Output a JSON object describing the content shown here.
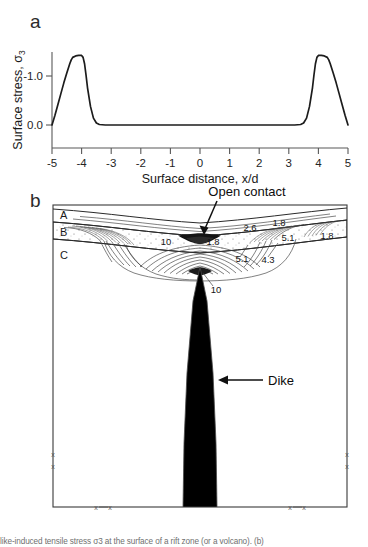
{
  "figure": {
    "panels": [
      {
        "letter": "a"
      },
      {
        "letter": "b"
      }
    ]
  },
  "panel_a": {
    "letter": "a",
    "xlabel_main": "Surface distance, ",
    "xlabel_var": "x/d",
    "ylabel_main": "Surface stress, ",
    "ylabel_var": "σ",
    "ylabel_sub": "3",
    "x_ticks": [
      "-5",
      "-4",
      "-3",
      "-2",
      "-1",
      "0",
      "1",
      "2",
      "3",
      "4",
      "5"
    ],
    "y_ticks": [
      "-1.0",
      "0.0"
    ]
  },
  "panel_b": {
    "letter": "b",
    "layer_labels": [
      "A",
      "B",
      "C"
    ],
    "contour_labels": [
      "1.8",
      "2.6",
      "1.8",
      "5.1",
      "1.8",
      "10",
      "5.1",
      "4.3",
      "10"
    ],
    "annotations": [
      {
        "text": "Open contact"
      },
      {
        "text": "Dike"
      }
    ],
    "boundary_marks": [
      "x",
      "x",
      "x",
      "x",
      "x",
      "x",
      "x",
      "x"
    ],
    "dike_fill": "#808080"
  },
  "caption": {
    "text": "like-induced tensile stress σ3 at the surface of a rift zone (or a volcano).  (b)"
  },
  "chart_data": {
    "type": "line",
    "title": "",
    "xlabel": "Surface distance, x/d",
    "ylabel": "Surface stress, σ3",
    "xlim": [
      -5,
      5
    ],
    "ylim": [
      -1.6,
      0.35
    ],
    "y_inverted": true,
    "grid": false,
    "legend": "none",
    "x_ticks": [
      -5,
      -4,
      -3,
      -2,
      -1,
      0,
      1,
      2,
      3,
      4,
      5
    ],
    "y_ticks": [
      -1.0,
      0.0
    ],
    "series": [
      {
        "name": "Surface stress",
        "x": [
          -5.0,
          -4.9,
          -4.8,
          -4.7,
          -4.6,
          -4.5,
          -4.4,
          -4.35,
          -4.3,
          -4.2,
          -4.1,
          -4.0,
          -3.95,
          -3.9,
          -3.85,
          -3.8,
          -3.7,
          -3.6,
          -3.5,
          -3.4,
          -3.2,
          -3.0,
          -2.5,
          -2.0,
          -1.0,
          0.0,
          1.0,
          2.0,
          2.5,
          3.0,
          3.2,
          3.4,
          3.5,
          3.6,
          3.7,
          3.8,
          3.85,
          3.9,
          3.95,
          4.0,
          4.1,
          4.2,
          4.3,
          4.35,
          4.4,
          4.5,
          4.6,
          4.7,
          4.8,
          4.9,
          5.0
        ],
        "y": [
          0.0,
          -0.2,
          -0.42,
          -0.64,
          -0.86,
          -1.06,
          -1.25,
          -1.33,
          -1.38,
          -1.41,
          -1.42,
          -1.42,
          -1.38,
          -1.25,
          -1.02,
          -0.76,
          -0.38,
          -0.14,
          -0.04,
          -0.01,
          0.0,
          0.0,
          0.0,
          0.0,
          0.0,
          0.0,
          0.0,
          0.0,
          0.0,
          0.0,
          0.0,
          -0.01,
          -0.04,
          -0.14,
          -0.38,
          -0.76,
          -1.02,
          -1.25,
          -1.38,
          -1.42,
          -1.42,
          -1.41,
          -1.38,
          -1.33,
          -1.25,
          -1.06,
          -0.86,
          -0.64,
          -0.42,
          -0.2,
          0.0
        ]
      }
    ]
  }
}
